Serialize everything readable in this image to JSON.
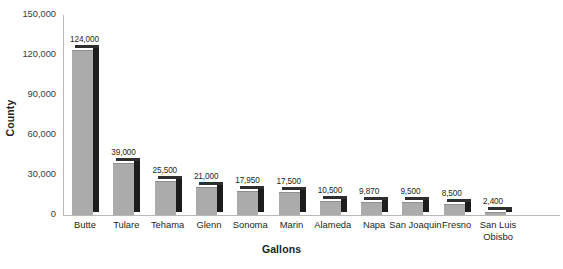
{
  "chart_data": {
    "type": "bar",
    "title": "",
    "xlabel": "Gallons",
    "ylabel": "County",
    "categories": [
      "Butte",
      "Tulare",
      "Tehama",
      "Glenn",
      "Sonoma",
      "Marin",
      "Alameda",
      "Napa",
      "San Joaquin",
      "Fresno",
      "San Luis\nObisbo"
    ],
    "values": [
      124000,
      39000,
      25500,
      21000,
      17950,
      17500,
      10500,
      9870,
      9500,
      8500,
      2400
    ],
    "value_labels": [
      "124,000",
      "39,000",
      "25,500",
      "21,000",
      "17,950",
      "17,500",
      "10,500",
      "9,870",
      "9,500",
      "8,500",
      "2,400"
    ],
    "ylim": [
      0,
      150000
    ],
    "yticks": [
      0,
      30000,
      60000,
      90000,
      120000,
      150000
    ],
    "ytick_labels": [
      "0",
      "30,000",
      "60,000",
      "90,000",
      "120,000",
      "150,000"
    ],
    "grid": false,
    "legend": null,
    "bar_color": "#ababab",
    "bar_side_color": "#1c1c1c",
    "axis_color": "#b8b8b8",
    "text_color": "#231f20"
  }
}
